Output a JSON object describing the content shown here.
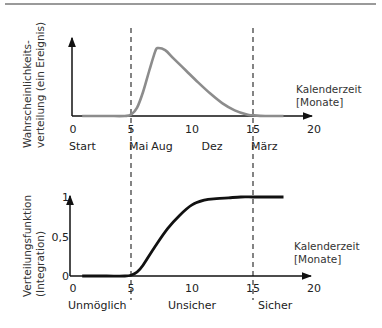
{
  "chart_data": [
    {
      "type": "line",
      "title": "",
      "ylabel": "Wahrscheinlichkeits-verteilung (ein Ereignis)",
      "ylabel_lines": [
        "Wahrscheinlichkeits-",
        "verteilung (ein Ereignis)"
      ],
      "xlabel": "Kalenderzeit [Monate]",
      "xlabel_lines": [
        "Kalenderzeit",
        "[Monate]"
      ],
      "xticks": [
        "0",
        "5",
        "10",
        "15",
        "20"
      ],
      "xlim": [
        0,
        20
      ],
      "month_labels": [
        "Start",
        "Mai",
        "Aug",
        "Dez",
        "März"
      ],
      "month_label_positions": [
        0,
        5,
        7.7,
        11.8,
        15
      ],
      "reference_lines_x": [
        5,
        15
      ],
      "series": [
        {
          "name": "Wahrscheinlichkeitsdichte",
          "color": "#8c8c8c",
          "x": [
            1,
            3,
            4.5,
            5,
            5.5,
            6,
            6.5,
            7,
            7.2,
            7.8,
            8.5,
            9.5,
            10.5,
            11.5,
            12.5,
            13.5,
            14.5,
            15,
            16,
            17.5
          ],
          "y": [
            0.0,
            0.0,
            0.0,
            0.02,
            0.12,
            0.35,
            0.65,
            0.93,
            0.97,
            0.94,
            0.82,
            0.65,
            0.48,
            0.32,
            0.18,
            0.08,
            0.02,
            0.01,
            0.0,
            0.0
          ]
        }
      ],
      "grid": false,
      "legend": null
    },
    {
      "type": "line",
      "title": "",
      "ylabel": "Verteilungsfunktion (Integration)",
      "ylabel_lines": [
        "Verteilungsfunktion",
        "(Integration)"
      ],
      "xlabel": "Kalenderzeit [Monate]",
      "xlabel_lines": [
        "Kalenderzeit",
        "[Monate]"
      ],
      "xticks": [
        "0",
        "5",
        "10",
        "15",
        "20"
      ],
      "yticks": [
        "0",
        "0,5",
        "1"
      ],
      "xlim": [
        0,
        20
      ],
      "ylim": [
        0,
        1
      ],
      "region_labels": [
        "Unmöglich",
        "Unsicher",
        "Sicher"
      ],
      "reference_lines_x": [
        5,
        15
      ],
      "series": [
        {
          "name": "Verteilungsfunktion",
          "color": "#111111",
          "x": [
            1,
            3,
            4.5,
            5,
            5.5,
            6,
            7,
            8,
            9,
            10,
            11,
            12,
            13,
            14,
            15,
            16,
            17.5
          ],
          "y": [
            0.0,
            0.0,
            0.0,
            0.01,
            0.05,
            0.14,
            0.38,
            0.6,
            0.77,
            0.9,
            0.96,
            0.98,
            0.99,
            1.0,
            1.0,
            1.0,
            1.0
          ]
        }
      ],
      "grid": false,
      "legend": null
    }
  ]
}
